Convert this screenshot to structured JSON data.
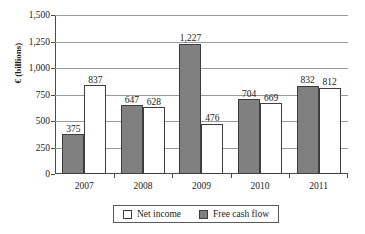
{
  "chart_data": {
    "type": "bar",
    "title": "",
    "subtitle": "",
    "xlabel": "",
    "ylabel": "€ (billions)",
    "categories": [
      "2007",
      "2008",
      "2009",
      "2010",
      "2011"
    ],
    "series": [
      {
        "name": "Free cash flow",
        "color": "#808080",
        "values": [
          375,
          647,
          1227,
          704,
          832
        ],
        "labels": [
          "375",
          "647",
          "1,227",
          "704",
          "832"
        ]
      },
      {
        "name": "Net income",
        "color": "#ffffff",
        "values": [
          837,
          628,
          476,
          669,
          812
        ],
        "labels": [
          "837",
          "628",
          "476",
          "669",
          "812"
        ]
      }
    ],
    "ylim": [
      0,
      1500
    ],
    "yticks": [
      0,
      250,
      500,
      750,
      1000,
      1250,
      1500
    ],
    "ytick_labels": [
      "0",
      "250",
      "500",
      "750",
      "1,000",
      "1,250",
      "1,500"
    ],
    "grid": true,
    "legend_position": "bottom",
    "bar_order_in_group": [
      "Free cash flow",
      "Net income"
    ]
  },
  "legend": {
    "items": [
      {
        "label": "Net income",
        "swatch": "white-square-swatch"
      },
      {
        "label": "Free cash flow",
        "swatch": "gray-square-swatch"
      }
    ]
  },
  "colors": {
    "free_cash_flow": "#808080",
    "net_income": "#ffffff",
    "bar_outline": "#3d3d3d",
    "gridline": "#9a9a9a",
    "axis": "#4a4a4a",
    "background": "#ffffff",
    "text": "#1a1a1a"
  }
}
